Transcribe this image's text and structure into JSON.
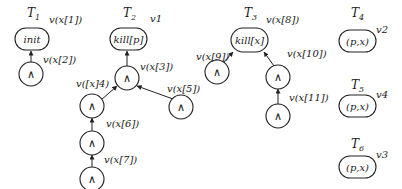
{
  "trees": [
    {
      "id": "T1",
      "title": "T",
      "subscript": "1",
      "root": {
        "text": "init",
        "label": "v(x[1])"
      },
      "nodes": [
        {
          "text": "∧",
          "label": "v(x[2])"
        }
      ]
    },
    {
      "id": "T2",
      "title": "T",
      "subscript": "2",
      "root": {
        "text": "kill[p]",
        "label": "v1"
      },
      "nodes": [
        {
          "text": "∧",
          "label": "v(x[3])"
        },
        {
          "text": "∧",
          "label": "v([x]4)"
        },
        {
          "text": "∧",
          "label": "v(x[5])"
        },
        {
          "text": "∧",
          "label": "v(x[6])"
        },
        {
          "text": "∧",
          "label": "v(x[7])"
        }
      ]
    },
    {
      "id": "T3",
      "title": "T",
      "subscript": "3",
      "root": {
        "text": "kill[x]",
        "label": "v(x[8])"
      },
      "nodes": [
        {
          "text": "∧",
          "label": "v(x[9])"
        },
        {
          "text": "∧",
          "label": "v(x[10])"
        },
        {
          "text": "∧",
          "label": "v(x[11])"
        }
      ]
    },
    {
      "id": "T4",
      "title": "T",
      "subscript": "4",
      "root": {
        "text": "(p,x)",
        "label": "v2"
      }
    },
    {
      "id": "T5",
      "title": "T",
      "subscript": "5",
      "root": {
        "text": "(p,x)",
        "label": "v4"
      }
    },
    {
      "id": "T6",
      "title": "T",
      "subscript": "6",
      "root": {
        "text": "(p,x)",
        "label": "v3"
      }
    }
  ]
}
